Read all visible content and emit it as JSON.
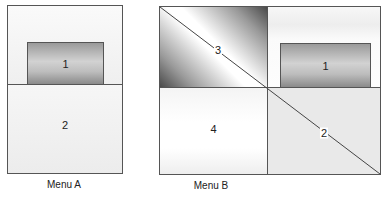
{
  "menu_a": {
    "caption": "Menu A",
    "regions": [
      {
        "id": "1",
        "label": "1",
        "description": "gradient button in top half"
      },
      {
        "id": "2",
        "label": "2",
        "description": "bottom half"
      }
    ]
  },
  "menu_b": {
    "caption": "Menu B",
    "regions": [
      {
        "id": "1",
        "label": "1",
        "description": "gradient button in top-right quadrant"
      },
      {
        "id": "2",
        "label": "2",
        "description": "bottom-right quadrant"
      },
      {
        "id": "3",
        "label": "3",
        "description": "top-left gradient quadrant"
      },
      {
        "id": "4",
        "label": "4",
        "description": "bottom-left quadrant"
      }
    ]
  },
  "colors": {
    "border": "#555555",
    "background": "#ffffff"
  }
}
